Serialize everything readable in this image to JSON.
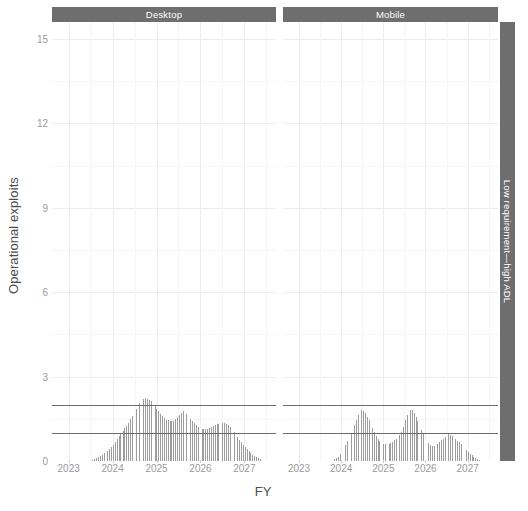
{
  "chart_data": {
    "type": "bar",
    "title": "",
    "xlabel": "FY",
    "ylabel": "Operational exploits",
    "ylim": [
      0,
      15.6
    ],
    "yticks": [
      0,
      3,
      6,
      9,
      12,
      15
    ],
    "xlim": [
      2022.62,
      2027.72
    ],
    "xticks": [
      2023,
      2024,
      2025,
      2026,
      2027
    ],
    "xtick_labels": [
      "2023",
      "2024",
      "2025",
      "2026",
      "2027"
    ],
    "grid": true,
    "legend": null,
    "bar_color": "#9c9c9c",
    "strip_color": "#6e6e6e",
    "strip_text_color": "#ffffff",
    "gridline_color": "#ededed",
    "reference_lines": [
      {
        "y": 2,
        "color": "#6a6a6a",
        "label": ""
      },
      {
        "y": 1,
        "color": "#6a6a6a",
        "label": ""
      }
    ],
    "facet_rows": [
      "Low requirement—high ADL"
    ],
    "facet_cols": [
      "Desktop",
      "Mobile"
    ],
    "bar_width_fy": 0.0425,
    "panels": [
      {
        "col": "Desktop",
        "row": "Low requirement—high ADL",
        "x": [
          2023.56,
          2023.6,
          2023.65,
          2023.69,
          2023.73,
          2023.78,
          2023.82,
          2023.86,
          2023.9,
          2023.95,
          2023.99,
          2024.03,
          2024.08,
          2024.12,
          2024.16,
          2024.2,
          2024.25,
          2024.29,
          2024.33,
          2024.38,
          2024.42,
          2024.46,
          2024.5,
          2024.55,
          2024.59,
          2024.63,
          2024.68,
          2024.72,
          2024.76,
          2024.8,
          2024.85,
          2024.89,
          2024.93,
          2024.98,
          2025.02,
          2025.06,
          2025.1,
          2025.15,
          2025.19,
          2025.23,
          2025.28,
          2025.32,
          2025.36,
          2025.4,
          2025.45,
          2025.49,
          2025.53,
          2025.58,
          2025.62,
          2025.66,
          2025.7,
          2025.75,
          2025.79,
          2025.83,
          2025.88,
          2025.92,
          2025.96,
          2026.0,
          2026.05,
          2026.09,
          2026.13,
          2026.18,
          2026.22,
          2026.26,
          2026.3,
          2026.35,
          2026.39,
          2026.43,
          2026.48,
          2026.52,
          2026.56,
          2026.6,
          2026.65,
          2026.69,
          2026.73,
          2026.78,
          2026.82,
          2026.86,
          2026.9,
          2026.95,
          2026.99,
          2027.03,
          2027.08,
          2027.12,
          2027.16,
          2027.2,
          2027.25,
          2027.29,
          2027.33,
          2027.38
        ],
        "y": [
          0.05,
          0.08,
          0.1,
          0.14,
          0.17,
          0.22,
          0.27,
          0.3,
          0.36,
          0.42,
          0.5,
          0.58,
          0.68,
          0.78,
          0.88,
          0.97,
          1.06,
          1.16,
          1.26,
          1.36,
          1.48,
          1.6,
          1.73,
          1.85,
          1.97,
          2.06,
          2.14,
          2.22,
          2.25,
          2.22,
          2.17,
          2.12,
          2.04,
          1.95,
          1.86,
          1.77,
          1.68,
          1.6,
          1.53,
          1.47,
          1.44,
          1.42,
          1.41,
          1.43,
          1.48,
          1.56,
          1.65,
          1.72,
          1.76,
          1.74,
          1.68,
          1.6,
          1.51,
          1.43,
          1.35,
          1.28,
          1.22,
          1.17,
          1.14,
          1.13,
          1.13,
          1.15,
          1.18,
          1.21,
          1.24,
          1.27,
          1.3,
          1.33,
          1.35,
          1.36,
          1.35,
          1.32,
          1.27,
          1.2,
          1.12,
          1.03,
          0.94,
          0.85,
          0.76,
          0.67,
          0.58,
          0.5,
          0.42,
          0.35,
          0.28,
          0.22,
          0.17,
          0.13,
          0.09,
          0.06
        ]
      },
      {
        "col": "Mobile",
        "row": "Low requirement—high ADL",
        "x": [
          2023.86,
          2023.9,
          2023.95,
          2023.99,
          2024.03,
          2024.08,
          2024.12,
          2024.16,
          2024.2,
          2024.25,
          2024.29,
          2024.33,
          2024.38,
          2024.42,
          2024.46,
          2024.5,
          2024.55,
          2024.59,
          2024.63,
          2024.68,
          2024.72,
          2024.76,
          2024.8,
          2024.85,
          2024.89,
          2024.93,
          2024.98,
          2025.02,
          2025.06,
          2025.1,
          2025.15,
          2025.19,
          2025.23,
          2025.28,
          2025.32,
          2025.36,
          2025.4,
          2025.45,
          2025.49,
          2025.53,
          2025.58,
          2025.62,
          2025.66,
          2025.7,
          2025.75,
          2025.79,
          2025.83,
          2025.88,
          2025.92,
          2025.96,
          2026.0,
          2026.05,
          2026.09,
          2026.13,
          2026.18,
          2026.22,
          2026.26,
          2026.3,
          2026.35,
          2026.39,
          2026.43,
          2026.48,
          2026.52,
          2026.56,
          2026.6,
          2026.65,
          2026.69,
          2026.73,
          2026.78,
          2026.82,
          2026.86,
          2026.9,
          2026.95,
          2026.99,
          2027.03,
          2027.08,
          2027.12,
          2027.16,
          2027.2,
          2027.25,
          2027.29,
          2027.33
        ],
        "y": [
          0.06,
          0.1,
          0.16,
          0.24,
          0.34,
          0.46,
          0.58,
          0.7,
          0.82,
          0.95,
          1.1,
          1.28,
          1.46,
          1.62,
          1.74,
          1.8,
          1.78,
          1.7,
          1.58,
          1.44,
          1.3,
          1.16,
          1.02,
          0.9,
          0.8,
          0.72,
          0.66,
          0.62,
          0.6,
          0.6,
          0.62,
          0.65,
          0.69,
          0.73,
          0.78,
          0.84,
          0.92,
          1.04,
          1.22,
          1.45,
          1.64,
          1.76,
          1.82,
          1.8,
          1.72,
          1.58,
          1.42,
          1.26,
          1.1,
          0.95,
          0.82,
          0.72,
          0.64,
          0.58,
          0.55,
          0.54,
          0.56,
          0.6,
          0.66,
          0.73,
          0.8,
          0.87,
          0.92,
          0.95,
          0.94,
          0.9,
          0.84,
          0.78,
          0.72,
          0.66,
          0.6,
          0.53,
          0.46,
          0.39,
          0.32,
          0.26,
          0.2,
          0.15,
          0.11,
          0.08,
          0.05,
          0.03
        ]
      }
    ]
  }
}
